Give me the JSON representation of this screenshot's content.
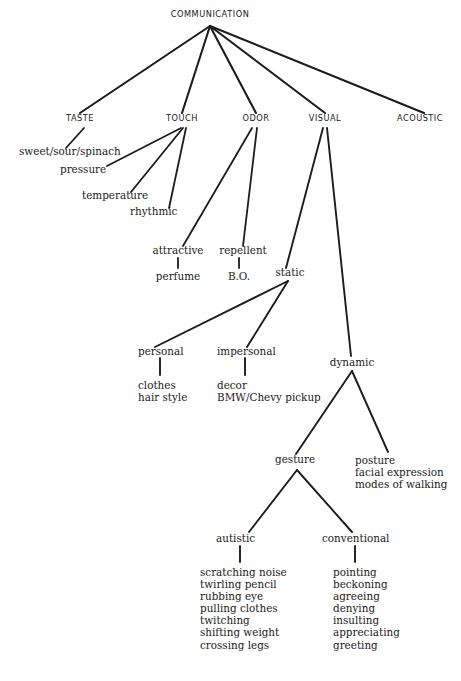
{
  "diagram": {
    "type": "tree",
    "title": "COMMUNICATION",
    "root": {
      "label": "COMMUNICATION",
      "x": 210,
      "y": 16
    },
    "channels": [
      {
        "label": "TASTE",
        "x": 80,
        "y": 120
      },
      {
        "label": "TOUCH",
        "x": 182,
        "y": 120
      },
      {
        "label": "ODOR",
        "x": 256,
        "y": 120
      },
      {
        "label": "VISUAL",
        "x": 325,
        "y": 120
      },
      {
        "label": "ACOUSTIC",
        "x": 420,
        "y": 120
      }
    ],
    "taste_children": [
      {
        "label": "sweet/sour/spinach",
        "x": 19,
        "y": 151
      }
    ],
    "touch_children": [
      {
        "label": "pressure",
        "x": 60,
        "y": 169
      },
      {
        "label": "temperature",
        "x": 82,
        "y": 196
      },
      {
        "label": "rhythmic",
        "x": 130,
        "y": 211
      }
    ],
    "odor_children": [
      {
        "label": "attractive",
        "x": 178,
        "y": 250
      },
      {
        "label": "repellent",
        "x": 245,
        "y": 250
      }
    ],
    "odor_grandchildren": [
      {
        "label": "perfume",
        "x": 178,
        "y": 276
      },
      {
        "label": "B.O.",
        "x": 239,
        "y": 276
      }
    ],
    "visual_children": [
      {
        "label": "static",
        "x": 287,
        "y": 272
      },
      {
        "label": "dynamic",
        "x": 352,
        "y": 362
      }
    ],
    "static_children": [
      {
        "label": "personal",
        "x": 160,
        "y": 351
      },
      {
        "label": "impersonal",
        "x": 245,
        "y": 351
      }
    ],
    "static_leaves": [
      {
        "owner": "personal",
        "items": [
          "clothes",
          "hair style"
        ],
        "x": 138,
        "y": 384
      },
      {
        "owner": "impersonal",
        "items": [
          "decor",
          "BMW/Chevy pickup"
        ],
        "x": 217,
        "y": 384
      }
    ],
    "dynamic_children": [
      {
        "label": "gesture",
        "x": 297,
        "y": 459
      }
    ],
    "dynamic_leaves": [
      {
        "items": [
          "posture",
          "facial expression",
          "modes of walking"
        ],
        "x": 355,
        "y": 454
      }
    ],
    "gesture_children": [
      {
        "label": "autistic",
        "x": 240,
        "y": 538
      },
      {
        "label": "conventional",
        "x": 355,
        "y": 538
      }
    ],
    "gesture_leaves": [
      {
        "owner": "autistic",
        "x": 200,
        "y": 570,
        "items": [
          "scratching noise",
          "twirling pencil",
          "rubbing eye",
          "pulling clothes",
          "twitching",
          "shifting weight",
          "crossing legs"
        ]
      },
      {
        "owner": "conventional",
        "x": 333,
        "y": 570,
        "items": [
          "pointing",
          "beckoning",
          "agreeing",
          "denying",
          "insulting",
          "appreciating",
          "greeting"
        ]
      }
    ],
    "style": {
      "line_color": "#1c1c1c",
      "text_color": "#1a1a1a",
      "background": "#ffffff"
    }
  }
}
